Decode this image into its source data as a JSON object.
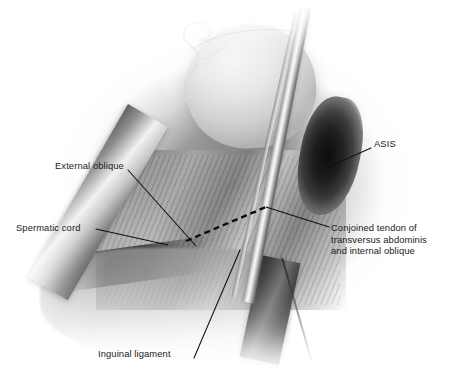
{
  "figure": {
    "modality": "greyscale surgical photograph",
    "background_color": "#ffffff",
    "label_color": "#1a1a1a",
    "leader_color": "#111111",
    "incision_marker": "dashed line"
  },
  "labels": [
    {
      "id": "external-oblique",
      "text": "External oblique",
      "x": 55,
      "y": 160,
      "leader": {
        "x1": 128,
        "y1": 170,
        "x2": 196,
        "y2": 246
      }
    },
    {
      "id": "spermatic-cord",
      "text": "Spermatic cord",
      "x": 16,
      "y": 222,
      "leader": {
        "x1": 96,
        "y1": 229,
        "x2": 168,
        "y2": 245
      }
    },
    {
      "id": "asis",
      "text": "ASIS",
      "x": 374,
      "y": 138,
      "leader": {
        "x1": 371,
        "y1": 148,
        "x2": 326,
        "y2": 168
      }
    },
    {
      "id": "conjoined-tendon",
      "text": "Conjoined tendon of\ntransversus abdominis\nand internal oblique",
      "x": 331,
      "y": 222,
      "lines": [
        "Conjoined tendon of",
        "transversus abdominis",
        "and internal oblique"
      ],
      "leader": {
        "x1": 329,
        "y1": 227,
        "x2": 266,
        "y2": 207
      }
    },
    {
      "id": "inguinal-ligament",
      "text": "Inguinal ligament",
      "x": 98,
      "y": 348,
      "leader": {
        "x1": 194,
        "y1": 358,
        "x2": 240,
        "y2": 250
      }
    }
  ],
  "incision": {
    "id": "dashed-incision-line",
    "x1": 186,
    "y1": 241,
    "x2": 266,
    "y2": 207
  }
}
